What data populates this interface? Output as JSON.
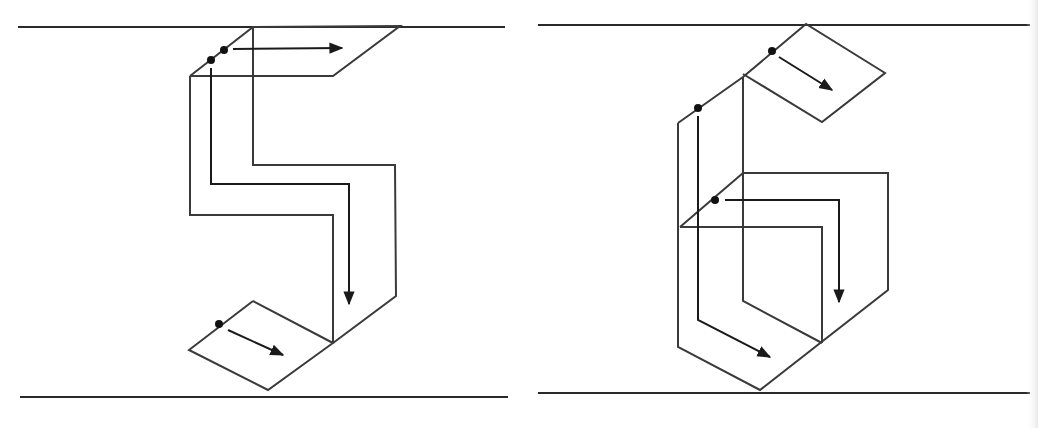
{
  "diagram": {
    "colors": {
      "background": "#ffffff",
      "line": "#3a3a3a",
      "arrow": "#1a1a1a",
      "rule": "#2a2a2a"
    },
    "panels": [
      {
        "id": "numeral-5",
        "label": "5",
        "rules": {
          "top": [
            [
              18,
              27
            ],
            [
              505,
              27
            ]
          ],
          "bottom": [
            [
              20,
              397
            ],
            [
              508,
              397
            ]
          ]
        },
        "outlines": [
          [
            [
              190,
              76
            ],
            [
              253,
              27
            ],
            [
              400,
              26
            ],
            [
              333,
              76
            ],
            [
              190,
              76
            ]
          ],
          [
            [
              190,
              76
            ],
            [
              190,
              215
            ],
            [
              333,
              215
            ],
            [
              333,
              343
            ]
          ],
          [
            [
              253,
              27
            ],
            [
              253,
              165
            ],
            [
              395,
              165
            ],
            [
              396,
              296
            ],
            [
              333,
              343
            ]
          ],
          [
            [
              253,
              301
            ],
            [
              189,
              350
            ],
            [
              268,
              390
            ],
            [
              333,
              343
            ],
            [
              253,
              301
            ]
          ]
        ],
        "strokes": [
          {
            "start": [
              211,
              60
            ],
            "points": [
              [
                211,
                68
              ],
              [
                211,
                184
              ],
              [
                349,
                184
              ],
              [
                349,
                304
              ]
            ]
          },
          {
            "start": [
              224,
              50
            ],
            "points": [
              [
                233,
                49
              ],
              [
                342,
                48
              ]
            ]
          },
          {
            "start": [
              219,
              324
            ],
            "points": [
              [
                228,
                330
              ],
              [
                283,
                355
              ]
            ]
          }
        ]
      },
      {
        "id": "numeral-6",
        "label": "6",
        "rules": {
          "top": [
            [
              538,
              25
            ],
            [
              1030,
              25
            ]
          ],
          "bottom": [
            [
              538,
              393
            ],
            [
              1030,
              393
            ]
          ]
        },
        "outlines": [
          [
            [
              678,
              123
            ],
            [
              743,
              77
            ],
            [
              806,
              24
            ],
            [
              885,
              73
            ],
            [
              822,
              122
            ],
            [
              743,
              74
            ]
          ],
          [
            [
              678,
              123
            ],
            [
              678,
              347
            ],
            [
              760,
              390
            ],
            [
              888,
              290
            ],
            [
              888,
              173
            ],
            [
              743,
              173
            ],
            [
              680,
              227
            ]
          ],
          [
            [
              743,
              77
            ],
            [
              743,
              301
            ],
            [
              822,
              343
            ]
          ],
          [
            [
              680,
              227
            ],
            [
              822,
              227
            ],
            [
              822,
              343
            ]
          ]
        ],
        "strokes": [
          {
            "start": [
              698,
              108
            ],
            "points": [
              [
                698,
                116
              ],
              [
                698,
                320
              ],
              [
                770,
                357
              ]
            ]
          },
          {
            "start": [
              715,
              200
            ],
            "points": [
              [
                725,
                200
              ],
              [
                839,
                200
              ],
              [
                839,
                302
              ]
            ]
          },
          {
            "start": [
              772,
              51
            ],
            "points": [
              [
                779,
                57
              ],
              [
                832,
                90
              ]
            ]
          }
        ]
      }
    ]
  }
}
